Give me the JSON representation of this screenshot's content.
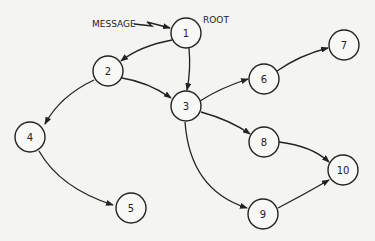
{
  "diagram": {
    "type": "directed-graph",
    "annotations": {
      "message_label": "MESSAGE",
      "root_label": "ROOT"
    },
    "nodes": [
      {
        "id": "1",
        "label": "1",
        "x": 186,
        "y": 33
      },
      {
        "id": "2",
        "label": "2",
        "x": 108,
        "y": 71
      },
      {
        "id": "3",
        "label": "3",
        "x": 186,
        "y": 106
      },
      {
        "id": "4",
        "label": "4",
        "x": 30,
        "y": 137
      },
      {
        "id": "5",
        "label": "5",
        "x": 131,
        "y": 208
      },
      {
        "id": "6",
        "label": "6",
        "x": 264,
        "y": 79
      },
      {
        "id": "7",
        "label": "7",
        "x": 344,
        "y": 45
      },
      {
        "id": "8",
        "label": "8",
        "x": 264,
        "y": 142
      },
      {
        "id": "9",
        "label": "9",
        "x": 263,
        "y": 214
      },
      {
        "id": "10",
        "label": "10",
        "x": 343,
        "y": 170
      }
    ],
    "edges": [
      {
        "from": "1",
        "to": "2"
      },
      {
        "from": "1",
        "to": "3"
      },
      {
        "from": "2",
        "to": "3"
      },
      {
        "from": "2",
        "to": "4"
      },
      {
        "from": "4",
        "to": "5"
      },
      {
        "from": "3",
        "to": "6"
      },
      {
        "from": "6",
        "to": "7"
      },
      {
        "from": "3",
        "to": "8"
      },
      {
        "from": "3",
        "to": "9"
      },
      {
        "from": "8",
        "to": "10"
      },
      {
        "from": "9",
        "to": "10"
      }
    ]
  }
}
